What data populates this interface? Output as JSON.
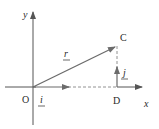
{
  "diagram": {
    "axes": {
      "x_label": "x",
      "y_label": "y",
      "origin_label": "O"
    },
    "points": {
      "C": "C",
      "D": "D"
    },
    "vectors": {
      "r": "r",
      "i": "i",
      "j": "j"
    },
    "colors": {
      "axis": "#555555",
      "vector": "#6b6b6b",
      "dashed": "#777777",
      "text": "#2a2a2a"
    }
  }
}
